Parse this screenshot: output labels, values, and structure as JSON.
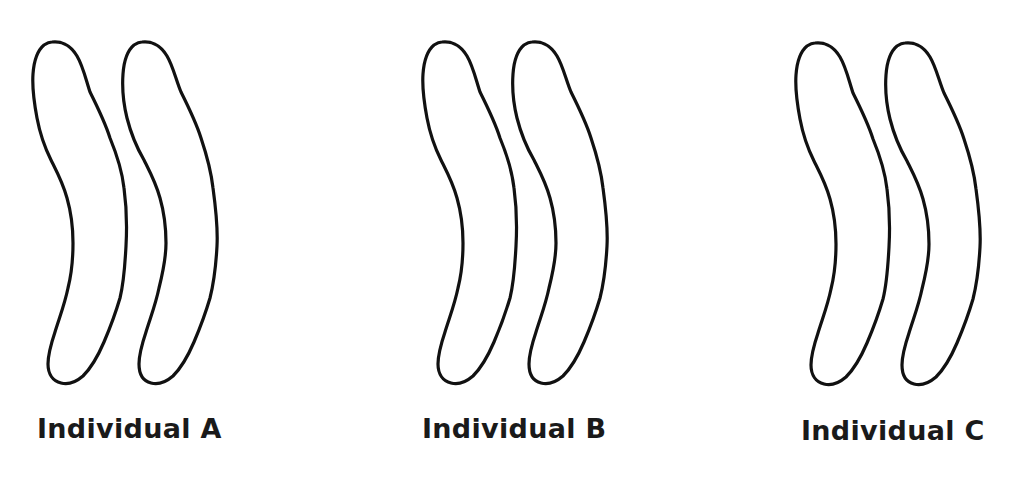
{
  "diagram": {
    "type": "homologous-chromosome-pairs",
    "stroke_color": "#111111",
    "fill_color": "#ffffff",
    "background": "#ffffff",
    "individuals": [
      {
        "id": "A",
        "label": "Individual A",
        "chromosome_count": 2,
        "offset_x": 0
      },
      {
        "id": "B",
        "label": "Individual B",
        "chromosome_count": 2,
        "offset_x": 390
      },
      {
        "id": "C",
        "label": "Individual C",
        "chromosome_count": 2,
        "offset_x": 763
      }
    ]
  }
}
